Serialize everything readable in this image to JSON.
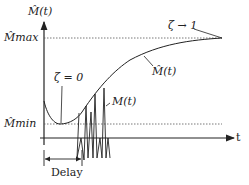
{
  "diagram": {
    "y_axis_label": "M̂(t)",
    "x_axis_label": "t",
    "levels": {
      "max_label": "M̂max",
      "min_label": "M̂min"
    },
    "annotations": {
      "zeta_zero": "ζ = 0",
      "zeta_one": "ζ → 1",
      "estimate_curve": "M̂(t)",
      "actual_curve": "M(t)",
      "delay": "Delay"
    },
    "colors": {
      "line": "#222222",
      "dotted": "#555555",
      "background": "#ffffff"
    }
  }
}
